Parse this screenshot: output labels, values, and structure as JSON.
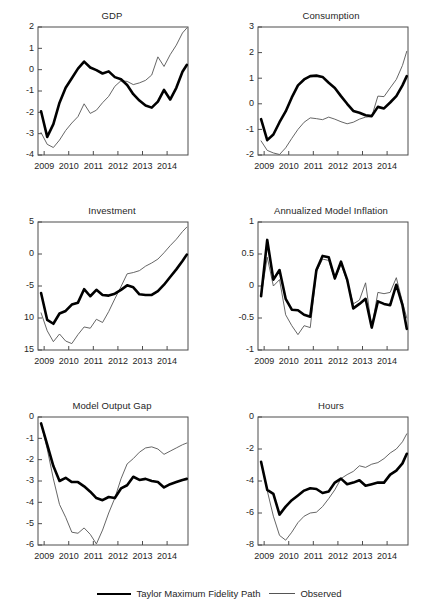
{
  "figure": {
    "width": 439,
    "height": 603,
    "background": "#ffffff",
    "series_colors": {
      "model": "#000000",
      "observed": "#555555"
    }
  },
  "legend": {
    "position": "bottom-center",
    "entries": [
      {
        "label": "Taylor Maximum Fidelity Path",
        "style": "thick-solid-black",
        "icon": "thick-line-swatch"
      },
      {
        "label": "Observed",
        "style": "thin-solid-gray",
        "icon": "thin-line-swatch"
      }
    ]
  },
  "chart_data": [
    {
      "id": "gdp",
      "type": "line",
      "title": "GDP",
      "xlabel": "",
      "ylabel": "",
      "xlim": [
        2008.75,
        2014.85
      ],
      "ylim": [
        -4,
        2
      ],
      "xticks": [
        2009,
        2010,
        2011,
        2012,
        2013,
        2014
      ],
      "xticklabels": [
        "2009",
        "2010",
        "2011",
        "2012",
        "2013",
        "2014"
      ],
      "yticks": [
        2,
        1,
        0,
        -1,
        -2,
        -3,
        -4
      ],
      "yticklabels": [
        "2",
        "1",
        "0",
        "-1",
        "-2",
        "-3",
        "-4"
      ],
      "grid": false,
      "x": [
        2008.875,
        2009.125,
        2009.375,
        2009.625,
        2009.875,
        2010.125,
        2010.375,
        2010.625,
        2010.875,
        2011.125,
        2011.375,
        2011.625,
        2011.875,
        2012.125,
        2012.375,
        2012.625,
        2012.875,
        2013.125,
        2013.375,
        2013.625,
        2013.875,
        2014.125,
        2014.375,
        2014.625,
        2014.8
      ],
      "series": [
        {
          "name": "Taylor Maximum Fidelity Path",
          "values": [
            -1.95,
            -3.15,
            -2.55,
            -1.55,
            -0.85,
            -0.4,
            0.05,
            0.38,
            0.1,
            -0.02,
            -0.18,
            -0.08,
            -0.35,
            -0.45,
            -0.72,
            -1.15,
            -1.45,
            -1.68,
            -1.78,
            -1.5,
            -0.95,
            -1.4,
            -0.85,
            -0.1,
            0.22
          ]
        },
        {
          "name": "Observed",
          "values": [
            -2.95,
            -3.5,
            -3.65,
            -3.3,
            -2.85,
            -2.5,
            -2.2,
            -1.6,
            -2.05,
            -1.9,
            -1.55,
            -1.25,
            -0.78,
            -0.52,
            -0.55,
            -0.7,
            -0.62,
            -0.5,
            -0.25,
            0.6,
            0.15,
            0.7,
            1.15,
            1.72,
            1.95
          ]
        }
      ]
    },
    {
      "id": "consumption",
      "type": "line",
      "title": "Consumption",
      "xlabel": "",
      "ylabel": "",
      "xlim": [
        2008.75,
        2014.85
      ],
      "ylim": [
        -2,
        3
      ],
      "xticks": [
        2009,
        2010,
        2011,
        2012,
        2013,
        2014
      ],
      "xticklabels": [
        "2009",
        "2010",
        "2011",
        "2012",
        "2013",
        "2014"
      ],
      "yticks": [
        3,
        2,
        1,
        0,
        -1,
        -2
      ],
      "yticklabels": [
        "3",
        "2",
        "1",
        "0",
        "-1",
        "-2"
      ],
      "grid": false,
      "x": [
        2008.875,
        2009.125,
        2009.375,
        2009.625,
        2009.875,
        2010.125,
        2010.375,
        2010.625,
        2010.875,
        2011.125,
        2011.375,
        2011.625,
        2011.875,
        2012.125,
        2012.375,
        2012.625,
        2012.875,
        2013.125,
        2013.375,
        2013.625,
        2013.875,
        2014.125,
        2014.375,
        2014.625,
        2014.8
      ],
      "series": [
        {
          "name": "Taylor Maximum Fidelity Path",
          "values": [
            -0.6,
            -1.42,
            -1.2,
            -0.72,
            -0.3,
            0.25,
            0.72,
            0.95,
            1.08,
            1.1,
            1.05,
            0.82,
            0.62,
            0.3,
            0.0,
            -0.28,
            -0.35,
            -0.45,
            -0.48,
            -0.12,
            -0.18,
            0.05,
            0.3,
            0.72,
            1.08
          ]
        },
        {
          "name": "Observed",
          "values": [
            -1.45,
            -1.82,
            -1.92,
            -1.98,
            -1.72,
            -1.35,
            -1.0,
            -0.72,
            -0.55,
            -0.58,
            -0.62,
            -0.52,
            -0.6,
            -0.7,
            -0.78,
            -0.72,
            -0.6,
            -0.52,
            -0.5,
            0.3,
            0.28,
            0.62,
            0.95,
            1.5,
            2.05
          ]
        }
      ]
    },
    {
      "id": "investment",
      "type": "line",
      "title": "Investment",
      "xlabel": "",
      "ylabel": "",
      "xlim": [
        2008.75,
        2014.85
      ],
      "ylim": [
        -15,
        5
      ],
      "xticks": [
        2009,
        2010,
        2011,
        2012,
        2013,
        2014
      ],
      "xticklabels": [
        "2009",
        "2010",
        "2011",
        "2012",
        "2013",
        "2014"
      ],
      "yticks": [
        5,
        0,
        -5,
        -10,
        -15
      ],
      "yticklabels": [
        "5",
        "0",
        "-5",
        "10",
        "15"
      ],
      "grid": false,
      "x": [
        2008.875,
        2009.125,
        2009.375,
        2009.625,
        2009.875,
        2010.125,
        2010.375,
        2010.625,
        2010.875,
        2011.125,
        2011.375,
        2011.625,
        2011.875,
        2012.125,
        2012.375,
        2012.625,
        2012.875,
        2013.125,
        2013.375,
        2013.625,
        2013.875,
        2014.125,
        2014.375,
        2014.625,
        2014.8
      ],
      "series": [
        {
          "name": "Taylor Maximum Fidelity Path",
          "values": [
            -6.1,
            -10.3,
            -10.9,
            -9.3,
            -8.9,
            -7.9,
            -7.6,
            -5.5,
            -6.6,
            -5.6,
            -6.4,
            -6.5,
            -6.2,
            -5.6,
            -4.9,
            -5.2,
            -6.3,
            -6.4,
            -6.4,
            -5.8,
            -4.8,
            -3.6,
            -2.4,
            -1.1,
            -0.1
          ]
        },
        {
          "name": "Observed",
          "values": [
            -9.2,
            -12.0,
            -13.7,
            -12.5,
            -13.6,
            -14.0,
            -12.6,
            -11.4,
            -11.6,
            -10.2,
            -10.7,
            -9.0,
            -7.0,
            -5.1,
            -3.1,
            -2.9,
            -2.6,
            -1.9,
            -1.4,
            -0.8,
            0.2,
            1.3,
            2.3,
            3.5,
            4.2
          ]
        }
      ]
    },
    {
      "id": "annualized-model-inflation",
      "type": "line",
      "title": "Annualized Model Inflation",
      "xlabel": "",
      "ylabel": "",
      "xlim": [
        2008.75,
        2014.85
      ],
      "ylim": [
        -1,
        1
      ],
      "xticks": [
        2009,
        2010,
        2011,
        2012,
        2013,
        2014
      ],
      "xticklabels": [
        "2009",
        "2010",
        "2011",
        "2012",
        "2013",
        "2014"
      ],
      "yticks": [
        1,
        0.5,
        0,
        -0.5,
        -1
      ],
      "yticklabels": [
        "1",
        "0.5",
        "0",
        "-0.5",
        "-1"
      ],
      "grid": false,
      "x": [
        2008.875,
        2009.125,
        2009.375,
        2009.625,
        2009.875,
        2010.125,
        2010.375,
        2010.625,
        2010.875,
        2011.125,
        2011.375,
        2011.625,
        2011.875,
        2012.125,
        2012.375,
        2012.625,
        2012.875,
        2013.125,
        2013.375,
        2013.625,
        2013.875,
        2014.125,
        2014.375,
        2014.625,
        2014.8
      ],
      "series": [
        {
          "name": "Taylor Maximum Fidelity Path",
          "values": [
            -0.16,
            0.72,
            0.1,
            0.25,
            -0.2,
            -0.37,
            -0.38,
            -0.45,
            -0.48,
            0.25,
            0.47,
            0.45,
            0.12,
            0.38,
            0.1,
            -0.35,
            -0.28,
            -0.2,
            -0.65,
            -0.24,
            -0.28,
            -0.3,
            0.02,
            -0.3,
            -0.67
          ]
        },
        {
          "name": "Observed",
          "values": [
            -0.16,
            0.45,
            0.0,
            0.1,
            -0.45,
            -0.62,
            -0.76,
            -0.62,
            -0.65,
            0.22,
            0.42,
            0.4,
            0.1,
            0.34,
            0.08,
            -0.28,
            -0.22,
            0.05,
            -0.65,
            -0.1,
            -0.12,
            -0.1,
            0.13,
            -0.25,
            -0.5
          ]
        }
      ]
    },
    {
      "id": "model-output-gap",
      "type": "line",
      "title": "Model Output Gap",
      "xlabel": "",
      "ylabel": "",
      "xlim": [
        2008.75,
        2014.85
      ],
      "ylim": [
        -6,
        0
      ],
      "xticks": [
        2009,
        2010,
        2011,
        2012,
        2013,
        2014
      ],
      "xticklabels": [
        "2009",
        "2010",
        "2011",
        "2012",
        "2013",
        "2014"
      ],
      "yticks": [
        0,
        -1,
        -2,
        -3,
        -4,
        -5,
        -6
      ],
      "yticklabels": [
        "0",
        "-1",
        "-2",
        "-3",
        "-4",
        "-5",
        "-6"
      ],
      "grid": false,
      "x": [
        2008.875,
        2009.125,
        2009.375,
        2009.625,
        2009.875,
        2010.125,
        2010.375,
        2010.625,
        2010.875,
        2011.125,
        2011.375,
        2011.625,
        2011.875,
        2012.125,
        2012.375,
        2012.625,
        2012.875,
        2013.125,
        2013.375,
        2013.625,
        2013.875,
        2014.125,
        2014.375,
        2014.625,
        2014.8
      ],
      "series": [
        {
          "name": "Taylor Maximum Fidelity Path",
          "values": [
            -0.3,
            -1.3,
            -2.3,
            -3.0,
            -2.85,
            -3.05,
            -3.05,
            -3.25,
            -3.5,
            -3.8,
            -3.9,
            -3.75,
            -3.8,
            -3.35,
            -3.2,
            -2.8,
            -2.95,
            -2.9,
            -3.0,
            -3.05,
            -3.3,
            -3.15,
            -3.05,
            -2.95,
            -2.9
          ]
        },
        {
          "name": "Observed",
          "values": [
            -0.3,
            -1.5,
            -2.9,
            -4.1,
            -4.7,
            -5.4,
            -5.45,
            -5.2,
            -5.5,
            -5.95,
            -5.3,
            -4.5,
            -3.8,
            -2.9,
            -2.2,
            -1.95,
            -1.65,
            -1.45,
            -1.4,
            -1.5,
            -1.75,
            -1.6,
            -1.45,
            -1.3,
            -1.22
          ]
        }
      ]
    },
    {
      "id": "hours",
      "type": "line",
      "title": "Hours",
      "xlabel": "",
      "ylabel": "",
      "xlim": [
        2008.75,
        2014.85
      ],
      "ylim": [
        -8,
        0
      ],
      "xticks": [
        2009,
        2010,
        2011,
        2012,
        2013,
        2014
      ],
      "xticklabels": [
        "2009",
        "2010",
        "2011",
        "2012",
        "2013",
        "2014"
      ],
      "yticks": [
        0,
        -2,
        -4,
        -6,
        -8
      ],
      "yticklabels": [
        "0",
        "-2",
        "-4",
        "-6",
        "-8"
      ],
      "grid": false,
      "x": [
        2008.875,
        2009.125,
        2009.375,
        2009.625,
        2009.875,
        2010.125,
        2010.375,
        2010.625,
        2010.875,
        2011.125,
        2011.375,
        2011.625,
        2011.875,
        2012.125,
        2012.375,
        2012.625,
        2012.875,
        2013.125,
        2013.375,
        2013.625,
        2013.875,
        2014.125,
        2014.375,
        2014.625,
        2014.8
      ],
      "series": [
        {
          "name": "Taylor Maximum Fidelity Path",
          "values": [
            -2.8,
            -4.55,
            -4.8,
            -6.1,
            -5.6,
            -5.2,
            -4.9,
            -4.6,
            -4.45,
            -4.5,
            -4.75,
            -4.65,
            -4.1,
            -3.85,
            -4.2,
            -4.1,
            -3.95,
            -4.3,
            -4.2,
            -4.1,
            -4.1,
            -3.6,
            -3.35,
            -2.9,
            -2.3
          ]
        },
        {
          "name": "Observed",
          "values": [
            -2.8,
            -4.6,
            -6.2,
            -7.4,
            -7.7,
            -7.2,
            -6.6,
            -6.2,
            -6.0,
            -5.95,
            -5.6,
            -5.1,
            -4.55,
            -3.85,
            -3.6,
            -3.4,
            -3.05,
            -3.15,
            -2.95,
            -2.85,
            -2.6,
            -2.25,
            -2.0,
            -1.55,
            -1.05
          ]
        }
      ]
    }
  ]
}
